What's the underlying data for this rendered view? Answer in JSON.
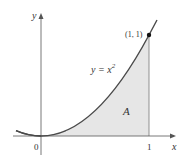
{
  "figure": {
    "type": "area-under-curve",
    "axis_labels": {
      "x": "x",
      "y": "y"
    },
    "origin_label": "0",
    "x_tick_label": "1",
    "curve_label": "y = x²",
    "curve_label_base": "y = x",
    "curve_label_exp": "2",
    "point_label": "(1, 1)",
    "region_label": "A",
    "colors": {
      "curve": "#4a4a4a",
      "fill": "#e6e6e6",
      "axes": "#555555",
      "point": "#111111"
    }
  }
}
